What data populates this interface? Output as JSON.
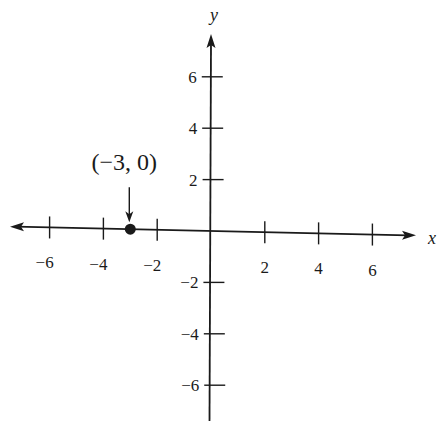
{
  "chart_data": {
    "type": "scatter",
    "title": "",
    "xlabel": "x",
    "ylabel": "y",
    "xlim": [
      -7.5,
      7.5
    ],
    "ylim": [
      -7.5,
      7.5
    ],
    "grid": false,
    "x_ticks": [
      -6,
      -4,
      -2,
      2,
      4,
      6
    ],
    "y_ticks": [
      6,
      4,
      2,
      -2,
      -4,
      -6
    ],
    "x_tick_labels": [
      "−6",
      "−4",
      "−2",
      "2",
      "4",
      "6"
    ],
    "y_tick_labels": [
      "6",
      "4",
      "2",
      "−2",
      "−4",
      "−6"
    ],
    "points": [
      {
        "x": -3,
        "y": 0,
        "label": "(−3, 0)"
      }
    ],
    "annotations": [
      {
        "text": "(−3, 0)",
        "target": [
          -3,
          0
        ],
        "arrow": "down"
      }
    ],
    "x_axis_arrows": "both",
    "y_axis_arrows": "top"
  },
  "colors": {
    "ink": "#1a1a1a",
    "background": "#ffffff"
  }
}
